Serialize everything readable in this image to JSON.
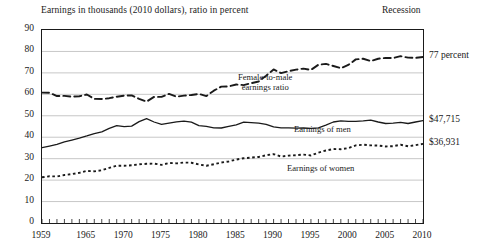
{
  "header": {
    "title": "Earnings in thousands (2010 dollars), ratio in percent",
    "recession_label": "Recession"
  },
  "chart_data": {
    "type": "line",
    "title": "Earnings in thousands (2010 dollars), ratio in percent",
    "xlabel": "",
    "ylabel": "Earnings in thousands (2010 dollars), ratio in percent",
    "xlim": [
      1959,
      2010
    ],
    "ylim": [
      0,
      90
    ],
    "ytick_step": 10,
    "yticks": [
      "0",
      "10",
      "20",
      "30",
      "40",
      "50",
      "60",
      "70",
      "80",
      "90"
    ],
    "xticks": [
      "1959",
      "1965",
      "1970",
      "1975",
      "1980",
      "1985",
      "1990",
      "1995",
      "2000",
      "2005",
      "2010"
    ],
    "grid": true,
    "legend": "inline-annotations",
    "x": [
      1959,
      1960,
      1961,
      1962,
      1963,
      1964,
      1965,
      1966,
      1967,
      1968,
      1969,
      1970,
      1971,
      1972,
      1973,
      1974,
      1975,
      1976,
      1977,
      1978,
      1979,
      1980,
      1981,
      1982,
      1983,
      1984,
      1985,
      1986,
      1987,
      1988,
      1989,
      1990,
      1991,
      1992,
      1993,
      1994,
      1995,
      1996,
      1997,
      1998,
      1999,
      2000,
      2001,
      2002,
      2003,
      2004,
      2005,
      2006,
      2007,
      2008,
      2009,
      2010
    ],
    "series": [
      {
        "name": "Female-to-male earnings ratio",
        "style": "dashed",
        "unit": "percent",
        "end_label": "77 percent",
        "values": [
          60.8,
          60.7,
          59.2,
          59.3,
          58.9,
          59.1,
          59.9,
          57.9,
          57.8,
          58.2,
          58.9,
          59.4,
          59.5,
          57.9,
          56.6,
          58.8,
          58.8,
          60.2,
          58.9,
          59.4,
          59.7,
          60.2,
          59.2,
          61.7,
          63.6,
          63.7,
          64.6,
          64.3,
          65.2,
          66.0,
          68.7,
          71.6,
          69.9,
          70.8,
          71.5,
          72.0,
          71.4,
          73.8,
          74.2,
          73.2,
          72.2,
          73.7,
          76.3,
          76.6,
          75.5,
          76.6,
          77.0,
          76.9,
          77.8,
          77.1,
          77.0,
          77.4
        ]
      },
      {
        "name": "Earnings of men",
        "style": "solid",
        "unit": "thousands of 2010 dollars",
        "end_label": "$47,715",
        "values": [
          35.1,
          35.9,
          36.7,
          37.8,
          38.7,
          39.6,
          40.6,
          41.7,
          42.5,
          44.1,
          45.4,
          44.9,
          45.2,
          47.3,
          48.7,
          47.1,
          46.0,
          46.6,
          47.2,
          47.5,
          47.0,
          45.4,
          45.1,
          44.4,
          44.3,
          45.1,
          45.8,
          47.0,
          46.8,
          46.6,
          46.0,
          44.8,
          44.4,
          44.4,
          44.2,
          44.3,
          44.1,
          44.4,
          45.6,
          47.1,
          47.6,
          47.4,
          47.4,
          47.6,
          48.0,
          47.1,
          46.4,
          46.6,
          46.9,
          46.4,
          47.1,
          47.7
        ]
      },
      {
        "name": "Earnings of women",
        "style": "dotted",
        "unit": "thousands of 2010 dollars",
        "end_label": "$36,931",
        "values": [
          21.3,
          21.8,
          21.7,
          22.4,
          22.8,
          23.4,
          24.3,
          24.1,
          24.6,
          25.7,
          26.7,
          26.7,
          26.9,
          27.4,
          27.6,
          27.7,
          27.1,
          28.0,
          27.8,
          28.2,
          28.1,
          27.3,
          26.7,
          27.4,
          28.2,
          28.7,
          29.6,
          30.2,
          30.5,
          30.8,
          31.6,
          32.1,
          31.0,
          31.4,
          31.6,
          31.9,
          31.5,
          32.8,
          33.8,
          34.5,
          34.4,
          34.9,
          36.2,
          36.5,
          36.2,
          36.1,
          35.7,
          35.8,
          36.5,
          35.8,
          36.3,
          36.9
        ]
      }
    ],
    "annotations": [
      {
        "text": "Female-to-male",
        "line2": "earnings ratio"
      },
      {
        "text": "Earnings of men"
      },
      {
        "text": "Earnings of women"
      }
    ]
  },
  "right_labels": {
    "ratio": "77 percent",
    "men": "$47,715",
    "women": "$36,931"
  },
  "series_labels": {
    "ratio_line1": "Female-to-male",
    "ratio_line2": "earnings ratio",
    "men": "Earnings of men",
    "women": "Earnings of women"
  },
  "colors": {
    "ink": "#1a1a1a",
    "grid": "#b9b9b9",
    "background": "#ffffff"
  }
}
